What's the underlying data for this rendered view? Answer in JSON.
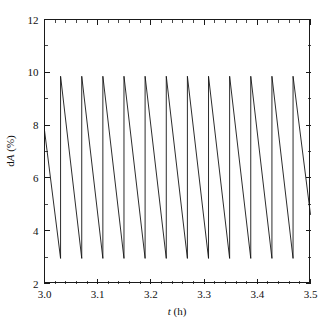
{
  "chart_data": {
    "type": "line",
    "title": "",
    "subtitle": "",
    "xlabel": "t (h)",
    "xlabel_italic_part": "t",
    "xlabel_rest": " (h)",
    "ylabel": "dA (%)",
    "ylabel_plain_prefix": "d",
    "ylabel_italic_part": "A",
    "ylabel_rest": " (%)",
    "xlim": [
      3.0,
      3.5
    ],
    "ylim": [
      2,
      12
    ],
    "grid": false,
    "legend": null,
    "legend_position": "none",
    "line_color": "#141414",
    "background_color": "#ffffff",
    "axis_color": "#1a1a1a",
    "xticks": [
      3.0,
      3.1,
      3.2,
      3.3,
      3.4,
      3.5
    ],
    "xticklabels": [
      "3.0",
      "3.1",
      "3.2",
      "3.3",
      "3.4",
      "3.5"
    ],
    "x_minor_per_interval": 4,
    "yticks": [
      2,
      4,
      6,
      8,
      10,
      12
    ],
    "yticklabels": [
      "2",
      "4",
      "6",
      "8",
      "10",
      "12"
    ],
    "y_minor_per_interval": 1,
    "waveform": "sawtooth-relaxation-oscillation",
    "peak_value": 9.85,
    "trough_value": 2.95,
    "period_h": 0.0397,
    "first_value_at_xmin": 7.8,
    "last_value_at_xmax": 4.6,
    "n_peaks_visible": 12,
    "series": [
      {
        "name": "dA",
        "x": [
          3.0,
          3.0302,
          3.0302,
          3.07,
          3.07,
          3.1097,
          3.1097,
          3.1494,
          3.1494,
          3.1891,
          3.1891,
          3.2289,
          3.2289,
          3.2686,
          3.2686,
          3.3083,
          3.3083,
          3.348,
          3.348,
          3.3877,
          3.3877,
          3.4275,
          3.4275,
          3.4672,
          3.4672,
          3.5
        ],
        "values": [
          7.8,
          2.95,
          9.85,
          2.95,
          9.85,
          2.95,
          9.85,
          2.95,
          9.85,
          2.95,
          9.85,
          2.95,
          9.85,
          2.95,
          9.85,
          2.95,
          9.85,
          2.95,
          9.85,
          2.95,
          9.85,
          2.95,
          9.85,
          2.95,
          9.85,
          4.6
        ]
      }
    ]
  },
  "figure": {
    "plot_area": {
      "left_px": 44,
      "top_px": 19,
      "right_px": 310,
      "bottom_px": 283
    }
  }
}
